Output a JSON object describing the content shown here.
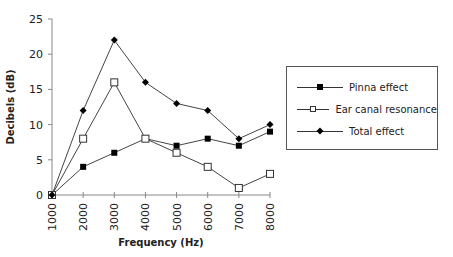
{
  "chart_data": {
    "type": "line",
    "title": "",
    "xlabel": "Frequency (Hz)",
    "ylabel": "Decibels (dB)",
    "x": [
      "1000",
      "2000",
      "3000",
      "4000",
      "5000",
      "6000",
      "7000",
      "8000"
    ],
    "ylim": [
      0,
      25
    ],
    "yticks": [
      0,
      5,
      10,
      15,
      20,
      25
    ],
    "grid": false,
    "legend_position": "right",
    "series": [
      {
        "name": "Pinna effect",
        "marker": "filled-square",
        "values": [
          0,
          4,
          6,
          8,
          7,
          8,
          7,
          9
        ]
      },
      {
        "name": "Ear canal resonance",
        "marker": "open-square",
        "values": [
          0,
          8,
          16,
          8,
          6,
          4,
          1,
          3
        ]
      },
      {
        "name": "Total effect",
        "marker": "filled-diamond",
        "values": [
          0,
          12,
          22,
          16,
          13,
          12,
          8,
          10
        ]
      }
    ]
  },
  "legend": {
    "items": [
      {
        "label": "Pinna effect"
      },
      {
        "label": "Ear canal resonance"
      },
      {
        "label": "Total effect"
      }
    ]
  }
}
